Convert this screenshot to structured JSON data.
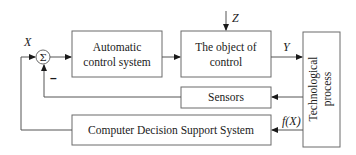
{
  "diagram": {
    "type": "block-diagram",
    "blocks": {
      "summator": {
        "symbol": "Σ"
      },
      "acs": {
        "line1": "Automatic",
        "line2": "control system"
      },
      "object": {
        "line1": "The object of",
        "line2": "control"
      },
      "tech": {
        "line1": "Technological",
        "line2": "process"
      },
      "sensors": {
        "label": "Sensors"
      },
      "cdss": {
        "label": "Computer Decision Support System"
      }
    },
    "signals": {
      "input": "X",
      "disturbance": "Z",
      "output": "Y",
      "function": "f(X)",
      "negative_sign": "–"
    }
  }
}
